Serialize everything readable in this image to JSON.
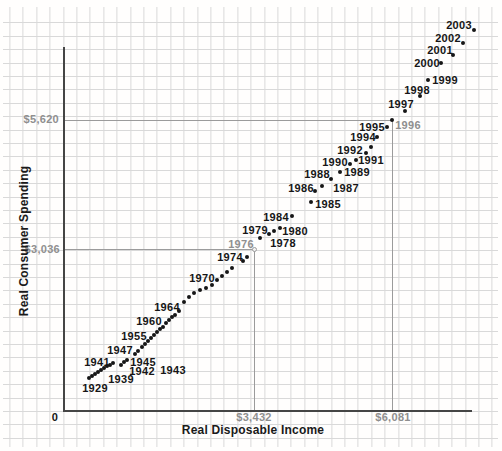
{
  "chart": {
    "x_axis_title": "Real Disposable Income",
    "y_axis_title": "Real Consumer Spending",
    "origin_label": "0"
  },
  "chart_data": {
    "type": "scatter",
    "title": "",
    "xlabel": "Real Disposable Income",
    "ylabel": "Real Consumer Spending",
    "grid": true,
    "x_tick_labels": [
      "0",
      "$3,432",
      "$6,081"
    ],
    "y_tick_labels": [
      "$3,036",
      "$5,620"
    ],
    "reference_points": [
      {
        "year": "1976",
        "income": "$3,432",
        "spending": "$3,036"
      },
      {
        "year": "1996",
        "income": "$6,081",
        "spending": "$5,620"
      }
    ],
    "calibration": {
      "origin_px": [
        63,
        411
      ],
      "x": [
        {
          "value": 3432,
          "px": 254
        },
        {
          "value": 6081,
          "px": 392
        }
      ],
      "y": [
        {
          "value": 3036,
          "px": 249
        },
        {
          "value": 5620,
          "px": 120
        }
      ]
    },
    "points_px": [
      [
        89,
        378
      ],
      [
        92,
        376
      ],
      [
        95,
        374
      ],
      [
        98,
        372
      ],
      [
        101,
        370
      ],
      [
        104,
        368
      ],
      [
        107,
        366
      ],
      [
        110,
        365
      ],
      [
        113,
        363
      ],
      [
        121,
        365
      ],
      [
        124,
        362
      ],
      [
        127,
        360
      ],
      [
        135,
        354
      ],
      [
        138,
        351
      ],
      [
        142,
        347
      ],
      [
        145,
        344
      ],
      [
        148,
        341
      ],
      [
        151,
        338
      ],
      [
        154,
        335
      ],
      [
        157,
        332
      ],
      [
        160,
        329
      ],
      [
        163,
        327
      ],
      [
        166,
        323
      ],
      [
        169,
        320
      ],
      [
        172,
        317
      ],
      [
        175,
        315
      ],
      [
        179,
        311
      ],
      [
        184,
        302
      ],
      [
        189,
        297
      ],
      [
        194,
        293
      ],
      [
        200,
        290
      ],
      [
        206,
        288
      ],
      [
        212,
        285
      ],
      [
        217,
        280
      ],
      [
        222,
        276
      ],
      [
        227,
        272
      ],
      [
        232,
        268
      ],
      [
        243,
        261
      ],
      [
        247,
        257
      ],
      [
        260,
        238
      ],
      [
        269,
        234
      ],
      [
        274,
        231
      ],
      [
        280,
        228
      ],
      [
        292,
        216
      ],
      [
        311,
        202
      ],
      [
        315,
        191
      ],
      [
        322,
        186
      ],
      [
        331,
        179
      ],
      [
        340,
        172
      ],
      [
        350,
        164
      ],
      [
        356,
        160
      ],
      [
        366,
        153
      ],
      [
        371,
        147
      ],
      [
        377,
        137
      ],
      [
        387,
        127
      ],
      [
        392,
        120
      ],
      [
        405,
        111
      ],
      [
        420,
        96
      ],
      [
        428,
        80
      ],
      [
        441,
        63
      ],
      [
        453,
        55
      ],
      [
        463,
        43
      ],
      [
        474,
        30
      ]
    ],
    "year_labels": [
      {
        "text": "1929",
        "x": 95,
        "y": 388
      },
      {
        "text": "1939",
        "x": 121,
        "y": 379
      },
      {
        "text": "1941",
        "x": 97,
        "y": 362
      },
      {
        "text": "1942",
        "x": 142,
        "y": 371
      },
      {
        "text": "1943",
        "x": 173,
        "y": 370
      },
      {
        "text": "1945",
        "x": 143,
        "y": 362
      },
      {
        "text": "1947",
        "x": 120,
        "y": 350
      },
      {
        "text": "1955",
        "x": 134,
        "y": 336
      },
      {
        "text": "1960",
        "x": 149,
        "y": 321
      },
      {
        "text": "1964",
        "x": 167,
        "y": 307
      },
      {
        "text": "1970",
        "x": 202,
        "y": 278
      },
      {
        "text": "1974",
        "x": 230,
        "y": 257
      },
      {
        "text": "1976",
        "x": 241,
        "y": 244,
        "gray": true
      },
      {
        "text": "1978",
        "x": 283,
        "y": 243
      },
      {
        "text": "1979",
        "x": 255,
        "y": 230
      },
      {
        "text": "1980",
        "x": 295,
        "y": 231
      },
      {
        "text": "1984",
        "x": 276,
        "y": 217
      },
      {
        "text": "1985",
        "x": 328,
        "y": 204
      },
      {
        "text": "1986",
        "x": 301,
        "y": 188
      },
      {
        "text": "1987",
        "x": 346,
        "y": 188
      },
      {
        "text": "1988",
        "x": 317,
        "y": 174
      },
      {
        "text": "1989",
        "x": 357,
        "y": 172
      },
      {
        "text": "1990",
        "x": 335,
        "y": 162
      },
      {
        "text": "1991",
        "x": 371,
        "y": 160
      },
      {
        "text": "1992",
        "x": 350,
        "y": 150
      },
      {
        "text": "1994",
        "x": 363,
        "y": 137
      },
      {
        "text": "1995",
        "x": 372,
        "y": 127
      },
      {
        "text": "1996",
        "x": 408,
        "y": 125,
        "gray": true
      },
      {
        "text": "1997",
        "x": 401,
        "y": 104
      },
      {
        "text": "1998",
        "x": 417,
        "y": 90
      },
      {
        "text": "1999",
        "x": 445,
        "y": 80
      },
      {
        "text": "2000",
        "x": 427,
        "y": 63
      },
      {
        "text": "2001",
        "x": 440,
        "y": 50
      },
      {
        "text": "2002",
        "x": 448,
        "y": 38
      },
      {
        "text": "2003",
        "x": 459,
        "y": 25
      }
    ],
    "tick_labels": [
      {
        "text": "$5,620",
        "x": 59,
        "y": 120,
        "align": "right"
      },
      {
        "text": "$3,036",
        "x": 60,
        "y": 250,
        "align": "right"
      },
      {
        "text": "$3,432",
        "x": 254,
        "y": 418,
        "align": "center"
      },
      {
        "text": "$6,081",
        "x": 393,
        "y": 418,
        "align": "center"
      },
      {
        "text": "0",
        "x": 55,
        "y": 418,
        "align": "center",
        "black": true
      }
    ],
    "reference_lines": [
      {
        "from": [
          63,
          120
        ],
        "to": [
          392,
          120
        ]
      },
      {
        "from": [
          392,
          120
        ],
        "to": [
          392,
          411
        ]
      },
      {
        "from": [
          63,
          249
        ],
        "to": [
          254,
          249
        ]
      },
      {
        "from": [
          254,
          249
        ],
        "to": [
          254,
          411
        ]
      }
    ],
    "reference_marker": {
      "x": 254,
      "y": 249
    }
  },
  "colors": {
    "background": "#fffefd",
    "grid_line": "#d9d9d9",
    "axis_line": "#454545",
    "reference_gray": "#9b9b9b",
    "dot_black": "#161616",
    "label_black": "#161616",
    "label_gray": "#8f8f8f"
  }
}
